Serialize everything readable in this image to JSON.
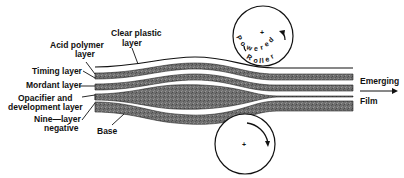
{
  "diagram": {
    "labels": {
      "clear_plastic_1": "Clear plastic",
      "clear_plastic_2": "layer",
      "acid_polymer_1": "Acid polymer",
      "acid_polymer_2": "layer",
      "timing": "Timing layer",
      "mordant": "Mordant layer",
      "opacifier_1": "Opacifier and",
      "opacifier_2": "development layer",
      "nine_layer_1": "Nine—layer",
      "nine_layer_2": "negative",
      "base": "Base",
      "emerging": "Emerging",
      "film": "Film"
    },
    "top_roller": {
      "text": "Powered Roller",
      "center_mark": "+"
    },
    "bottom_roller": {
      "center_mark": "+"
    },
    "colors": {
      "ink": "#111111",
      "band_fill": "#6e6e6e",
      "background": "#ffffff"
    }
  }
}
